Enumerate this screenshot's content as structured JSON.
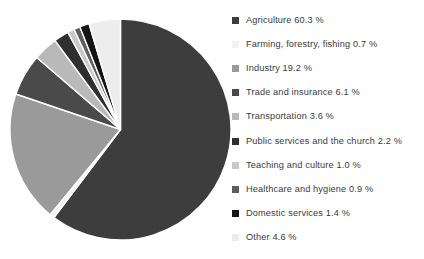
{
  "chart_data": {
    "type": "pie",
    "title": "",
    "subtitle": "",
    "xlabel": "",
    "ylabel": "",
    "legend_position": "right",
    "grid": false,
    "units": "percent",
    "start_angle_deg": 0,
    "direction": "clockwise",
    "categories": [
      "Agriculture",
      "Farming, forestry, fishing",
      "Industry",
      "Trade and insurance",
      "Transportation",
      "Public services and the church",
      "Teaching and culture",
      "Healthcare and hygiene",
      "Domestic services",
      "Other"
    ],
    "values": [
      60.3,
      0.7,
      19.2,
      6.1,
      3.6,
      2.2,
      1.0,
      0.9,
      1.4,
      4.6
    ],
    "value_labels": [
      "60.3 %",
      "0.7 %",
      "19.2 %",
      "6.1 %",
      "3.6 %",
      "2.2 %",
      "1.0 %",
      "0.9 %",
      "1.4 %",
      "4.6 %"
    ],
    "colors": [
      "#3d3d3d",
      "#f2f2f2",
      "#9a9a9a",
      "#4a4a4a",
      "#b9b9b9",
      "#2f2f2f",
      "#c9c9c9",
      "#5e5e5e",
      "#151515",
      "#ededed"
    ],
    "slice_border_color": "#ffffff"
  },
  "legend": {
    "items": [
      {
        "label": "Agriculture 60.3 %",
        "swatch": "#3d3d3d"
      },
      {
        "label": "Farming, forestry, fishing 0.7 %",
        "swatch": "#f2f2f2"
      },
      {
        "label": "Industry 19.2 %",
        "swatch": "#9a9a9a"
      },
      {
        "label": "Trade and insurance 6.1 %",
        "swatch": "#4a4a4a"
      },
      {
        "label": "Transportation 3.6 %",
        "swatch": "#b9b9b9"
      },
      {
        "label": "Public services and the church 2.2 %",
        "swatch": "#2f2f2f"
      },
      {
        "label": "Teaching and culture 1.0 %",
        "swatch": "#c9c9c9"
      },
      {
        "label": "Healthcare and hygiene 0.9 %",
        "swatch": "#5e5e5e"
      },
      {
        "label": "Domestic services 1.4 %",
        "swatch": "#151515"
      },
      {
        "label": "Other 4.6 %",
        "swatch": "#ededed"
      }
    ]
  },
  "canvas": {
    "background": "#ffffff",
    "text_color": "#3b3b3b"
  }
}
